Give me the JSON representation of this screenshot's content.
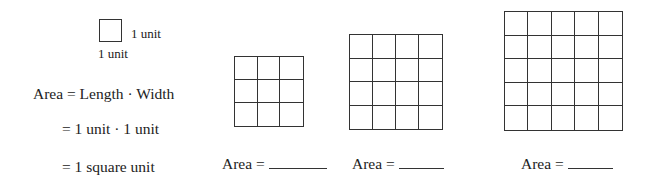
{
  "unit_example": {
    "right_label": "1 unit",
    "bottom_label": "1 unit"
  },
  "formula": {
    "line1": "Area = Length · Width",
    "line2": "= 1 unit · 1 unit",
    "line3": "= 1 square unit"
  },
  "grids": [
    {
      "rows": 3,
      "cols": 3,
      "label": "Area =",
      "blank": ""
    },
    {
      "rows": 4,
      "cols": 4,
      "label": "Area =",
      "blank": ""
    },
    {
      "rows": 5,
      "cols": 5,
      "label": "Area =",
      "blank": ""
    }
  ],
  "colors": {
    "line": "#333333",
    "text": "#222222",
    "background": "#ffffff"
  }
}
